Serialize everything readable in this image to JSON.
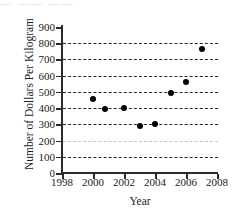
{
  "figure": {
    "top_artifact_text": "—   ——   ——"
  },
  "chart_data": {
    "type": "scatter",
    "title": "",
    "xlabel": "Year",
    "ylabel": "Number of Dollars Per Kilogram",
    "xlim": [
      1998,
      2008
    ],
    "ylim": [
      0,
      900
    ],
    "xticks": [
      1998,
      2000,
      2002,
      2004,
      2006,
      2008
    ],
    "yticks": [
      0,
      100,
      200,
      300,
      400,
      500,
      600,
      700,
      800,
      900
    ],
    "grid": "horizontal-dashed",
    "legend": "none",
    "x": [
      2000,
      2000.8,
      2002,
      2003,
      2004,
      2005,
      2006,
      2007
    ],
    "y": [
      455,
      395,
      398,
      292,
      305,
      495,
      560,
      765
    ],
    "points": [
      {
        "x": 2000,
        "y": 455
      },
      {
        "x": 2000.8,
        "y": 395
      },
      {
        "x": 2002,
        "y": 398
      },
      {
        "x": 2003,
        "y": 292
      },
      {
        "x": 2004,
        "y": 305
      },
      {
        "x": 2005,
        "y": 495
      },
      {
        "x": 2006,
        "y": 560
      },
      {
        "x": 2007,
        "y": 765
      }
    ]
  }
}
